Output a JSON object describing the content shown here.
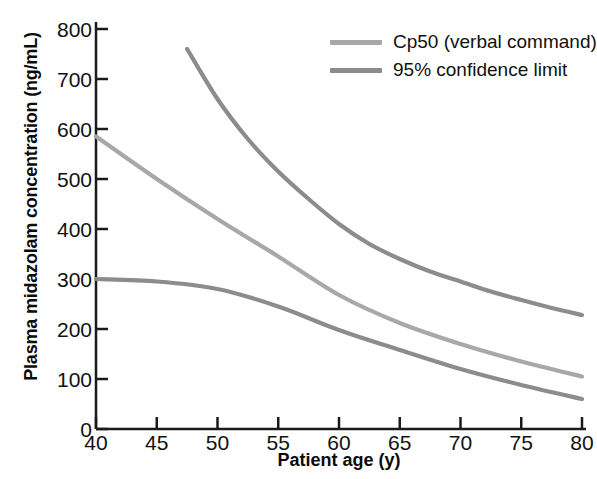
{
  "chart_data": {
    "type": "line",
    "title": "",
    "xlabel": "Patient age (y)",
    "ylabel": "Plasma midazolam concentration (ng/mL)",
    "xlim": [
      40,
      80
    ],
    "ylim": [
      0,
      800
    ],
    "xticks": [
      40,
      45,
      50,
      55,
      60,
      65,
      70,
      75,
      80
    ],
    "yticks": [
      0,
      100,
      200,
      300,
      400,
      500,
      600,
      700,
      800
    ],
    "grid": false,
    "legend_position": "top-right",
    "series": [
      {
        "name": "95% confidence limit",
        "role": "upper-confidence-limit",
        "color": "#8c8c8c",
        "x": [
          47.5,
          50,
          52.5,
          55,
          57.5,
          60,
          62.5,
          65,
          67.5,
          70,
          72.5,
          75,
          77.5,
          80
        ],
        "values": [
          760,
          660,
          580,
          515,
          460,
          410,
          370,
          340,
          315,
          295,
          275,
          258,
          242,
          228
        ]
      },
      {
        "name": "Cp50 (verbal command)",
        "role": "cp50",
        "color": "#a8a8a8",
        "x": [
          40,
          45,
          50,
          55,
          60,
          65,
          70,
          75,
          80
        ],
        "values": [
          585,
          500,
          420,
          345,
          268,
          212,
          170,
          135,
          105
        ]
      },
      {
        "name": "95% confidence limit",
        "role": "lower-confidence-limit",
        "color": "#8c8c8c",
        "x": [
          40,
          45,
          50,
          55,
          60,
          65,
          70,
          75,
          80
        ],
        "values": [
          300,
          295,
          280,
          245,
          198,
          158,
          120,
          88,
          60
        ]
      }
    ],
    "legend": [
      {
        "label": "Cp50 (verbal command)",
        "color": "#a8a8a8"
      },
      {
        "label": "95% confidence limit",
        "color": "#8c8c8c"
      }
    ]
  },
  "axis": {
    "y_labels": [
      "800",
      "700",
      "600",
      "500",
      "400",
      "300",
      "200",
      "100",
      "0"
    ],
    "x_labels": [
      "40",
      "45",
      "50",
      "55",
      "60",
      "65",
      "70",
      "75",
      "80"
    ]
  },
  "colors": {
    "axis": "#1a1a1a",
    "text": "#111111",
    "cp50": "#a8a8a8",
    "confidence": "#8c8c8c",
    "background": "#ffffff"
  }
}
